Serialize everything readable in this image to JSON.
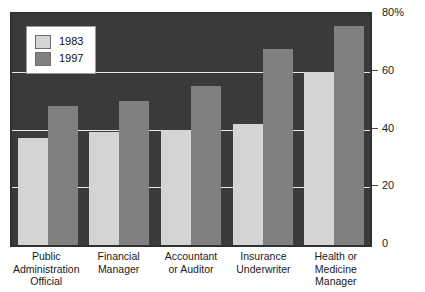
{
  "chart_data": {
    "type": "bar",
    "title": "",
    "xlabel": "",
    "ylabel": "",
    "ylim": [
      0,
      80
    ],
    "yticks": [
      0,
      20,
      40,
      60,
      80
    ],
    "ytick_labels": [
      "0",
      "20",
      "40",
      "60",
      "80%"
    ],
    "grid": true,
    "legend_position": "top-left",
    "categories": [
      "Public Administration Official",
      "Financial Manager",
      "Accountant or Auditor",
      "Insurance Underwriter",
      "Health or Medicine Manager"
    ],
    "series": [
      {
        "name": "1983",
        "color": "#d4d4d4",
        "values": [
          37,
          39,
          40,
          42,
          60
        ]
      },
      {
        "name": "1997",
        "color": "#808080",
        "values": [
          48,
          50,
          55,
          68,
          76
        ]
      }
    ]
  },
  "axis": {
    "y_ticks": [
      {
        "label": "80%",
        "value": 80
      },
      {
        "label": "60",
        "value": 60
      },
      {
        "label": "40",
        "value": 40
      },
      {
        "label": "20",
        "value": 20
      },
      {
        "label": "0",
        "value": 0
      }
    ],
    "x_labels": [
      {
        "lines": [
          "Public",
          "Administration",
          "Official"
        ]
      },
      {
        "lines": [
          "Financial",
          "Manager"
        ]
      },
      {
        "lines": [
          "Accountant",
          "or Auditor"
        ]
      },
      {
        "lines": [
          "Insurance",
          "Underwriter"
        ]
      },
      {
        "lines": [
          "Health or",
          "Medicine",
          "Manager"
        ]
      }
    ]
  },
  "legend": {
    "items": [
      {
        "label": "1983",
        "color": "#d4d4d4"
      },
      {
        "label": "1997",
        "color": "#808080"
      }
    ]
  },
  "style": {
    "plot_background": "#3a3a3a",
    "plot_border": "#303030",
    "gridline_color": "#e8e8e8",
    "page_background": "#ffffff",
    "text_color": "#1a1a1a"
  }
}
